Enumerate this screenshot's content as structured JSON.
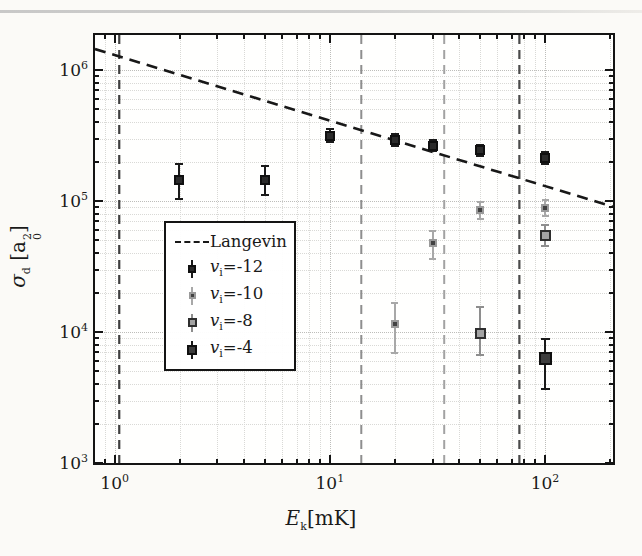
{
  "figure_kind": "log-log scatter plot with Langevin model line",
  "chart_data": {
    "type": "scatter",
    "title": "",
    "xlabel": {
      "sym": "E",
      "sym_sub": "k",
      "unit": "[mK]"
    },
    "ylabel": {
      "sym": "σ",
      "sym_sub": "d",
      "unit_pre": " [a",
      "unit_sub": "0",
      "unit_sup": "2",
      "unit_post": "]"
    },
    "xlim": [
      0.81,
      207
    ],
    "ylim": [
      1000,
      1850000
    ],
    "grid": "dotted, major and minor, both axes",
    "x_ticks": [
      {
        "v": 1,
        "base": "10",
        "exp": "0"
      },
      {
        "v": 10,
        "base": "10",
        "exp": "1"
      },
      {
        "v": 100,
        "base": "10",
        "exp": "2"
      }
    ],
    "y_ticks": [
      {
        "v": 1000,
        "base": "10",
        "exp": "3"
      },
      {
        "v": 10000,
        "base": "10",
        "exp": "4"
      },
      {
        "v": 100000,
        "base": "10",
        "exp": "5"
      },
      {
        "v": 1000000,
        "base": "10",
        "exp": "6"
      }
    ],
    "langevin": {
      "label": "Langevin",
      "coefficient": 1300000,
      "exponent": -0.5,
      "color": "#181818",
      "dash": "11 7",
      "width": 2.6
    },
    "threshold_lines": [
      {
        "x": 1.05,
        "color": "#3f3f3f",
        "width": 2.2,
        "dash": "9 6"
      },
      {
        "x": 14,
        "color": "#8e8e8e",
        "width": 2.0,
        "dash": "9 6"
      },
      {
        "x": 34,
        "color": "#a2a2a2",
        "width": 2.0,
        "dash": "9 6"
      },
      {
        "x": 76,
        "color": "#4a4a4a",
        "width": 2.2,
        "dash": "9 6"
      }
    ],
    "legend_position": "lower left of center, inside axes",
    "series": [
      {
        "name": "vi=-12",
        "label": {
          "sym": "v",
          "sub": "i",
          "val": "=-12"
        },
        "marker": {
          "shape": "square",
          "size": 10,
          "fill": "#2b2b2b",
          "edge": "#101010"
        },
        "err_color": "#1a1a1a",
        "cap_w": 8,
        "points": [
          {
            "x": 2,
            "y": 145000,
            "lo": 103000,
            "hi": 190000
          },
          {
            "x": 5,
            "y": 145000,
            "lo": 112000,
            "hi": 185000
          },
          {
            "x": 10,
            "y": 315000,
            "lo": 281000,
            "hi": 353000
          },
          {
            "x": 20,
            "y": 292000,
            "lo": 264000,
            "hi": 323000
          },
          {
            "x": 30,
            "y": 265000,
            "lo": 241000,
            "hi": 291000
          },
          {
            "x": 50,
            "y": 243000,
            "lo": 220000,
            "hi": 268000
          },
          {
            "x": 100,
            "y": 212000,
            "lo": 190000,
            "hi": 236000
          }
        ]
      },
      {
        "name": "vi=-10",
        "label": {
          "sym": "v",
          "sub": "i",
          "val": "=-10"
        },
        "marker": {
          "shape": "square",
          "size": 8,
          "fill": "#424242",
          "edge": "#9a9a9a"
        },
        "err_color": "#a8a8a8",
        "cap_w": 7,
        "points": [
          {
            "x": 20,
            "y": 11500,
            "lo": 6900,
            "hi": 16600
          },
          {
            "x": 30,
            "y": 48000,
            "lo": 36000,
            "hi": 59000
          },
          {
            "x": 50,
            "y": 85000,
            "lo": 73000,
            "hi": 98000
          },
          {
            "x": 100,
            "y": 88000,
            "lo": 77000,
            "hi": 101000
          }
        ]
      },
      {
        "name": "vi=-8",
        "label": {
          "sym": "v",
          "sub": "i",
          "val": "=-8"
        },
        "marker": {
          "shape": "square",
          "size": 11,
          "fill": "#a3a3a3",
          "edge": "#2e2e2e"
        },
        "err_color": "#8e8e8e",
        "cap_w": 8,
        "points": [
          {
            "x": 50,
            "y": 9800,
            "lo": 6700,
            "hi": 15500
          },
          {
            "x": 100,
            "y": 55000,
            "lo": 45000,
            "hi": 66000
          }
        ]
      },
      {
        "name": "vi=-4",
        "label": {
          "sym": "v",
          "sub": "i",
          "val": "=-4"
        },
        "marker": {
          "shape": "square",
          "size": 13,
          "fill": "#3d3d3d",
          "edge": "#101010"
        },
        "err_color": "#1a1a1a",
        "cap_w": 9,
        "points": [
          {
            "x": 100,
            "y": 6300,
            "lo": 3700,
            "hi": 8900
          }
        ]
      }
    ]
  }
}
